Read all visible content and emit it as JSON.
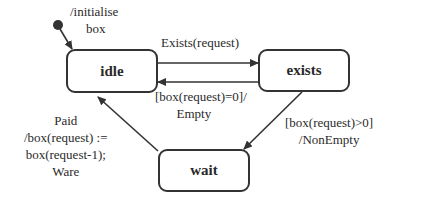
{
  "diagram": {
    "type": "state-machine",
    "states": [
      {
        "id": "idle",
        "label": "idle"
      },
      {
        "id": "exists",
        "label": "exists"
      },
      {
        "id": "wait",
        "label": "wait"
      }
    ],
    "initial": {
      "target": "idle",
      "action_lines": [
        "/initialise",
        "box"
      ]
    },
    "transitions": [
      {
        "from": "idle",
        "to": "exists",
        "lines": [
          "Exists(request)"
        ]
      },
      {
        "from": "exists",
        "to": "idle",
        "lines": [
          "[box(request)=0]/",
          "Empty"
        ]
      },
      {
        "from": "exists",
        "to": "wait",
        "lines": [
          "[box(request)>0]",
          "/NonEmpty"
        ]
      },
      {
        "from": "wait",
        "to": "idle",
        "lines": [
          "Paid",
          "/box(request) :=",
          "box(request-1);",
          "Ware"
        ]
      }
    ]
  },
  "colors": {
    "line": "#333333",
    "text": "#2a2a2a",
    "background": "#ffffff"
  }
}
